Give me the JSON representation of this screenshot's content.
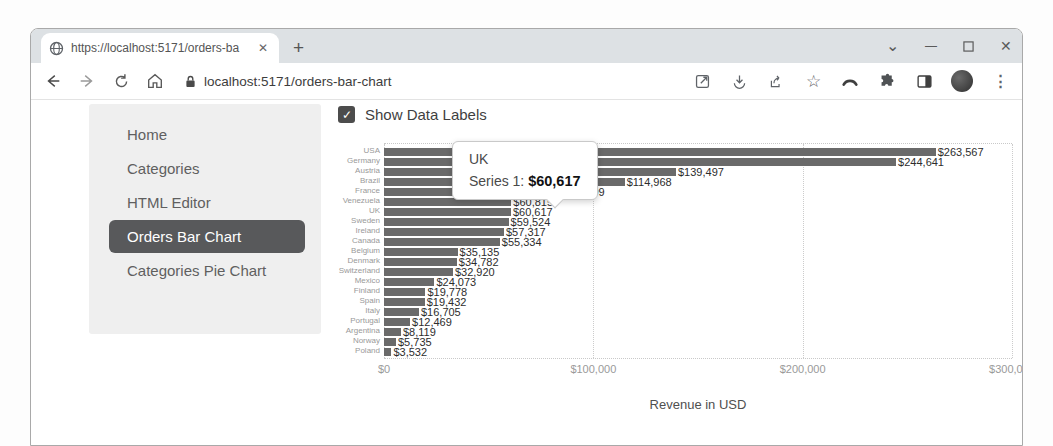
{
  "browser": {
    "tab": {
      "title": "https://localhost:5171/orders-ba",
      "close_glyph": "✕"
    },
    "new_tab_glyph": "+",
    "window_controls": {
      "restore_glyph": "⌄",
      "minimize_glyph": "—",
      "close_glyph": "✕"
    },
    "address": {
      "url": "localhost:5171/orders-bar-chart"
    },
    "toolbar_icon_names": [
      "open-in-new-icon",
      "download-icon",
      "share-icon",
      "bookmark-star-icon",
      "arc-icon",
      "extensions-puzzle-icon",
      "side-panel-icon",
      "profile-avatar",
      "menu-dots-icon"
    ],
    "menu_dots_glyph": "⋮",
    "star_glyph": "☆"
  },
  "sidebar": {
    "items": [
      {
        "label": "Home",
        "active": false
      },
      {
        "label": "Categories",
        "active": false
      },
      {
        "label": "HTML Editor",
        "active": false
      },
      {
        "label": "Orders Bar Chart",
        "active": true
      },
      {
        "label": "Categories Pie Chart",
        "active": false
      }
    ]
  },
  "main": {
    "show_data_labels": {
      "label": "Show Data Labels",
      "checked": true,
      "check_glyph": "✓"
    }
  },
  "chart_data": {
    "type": "bar",
    "orientation": "horizontal",
    "title": "",
    "xlabel": "Revenue in USD",
    "ylabel": "",
    "xlim": [
      0,
      300000
    ],
    "x_ticks": [
      "$0",
      "$100,000",
      "$200,000",
      "$300,000"
    ],
    "grid": "dotted-vertical",
    "bar_color": "#6a6a6a",
    "series_name": "Series 1",
    "categories": [
      "USA",
      "Germany",
      "Austria",
      "Brazil",
      "France",
      "Venezuela",
      "UK",
      "Sweden",
      "Ireland",
      "Canada",
      "Belgium",
      "Denmark",
      "Switzerland",
      "Mexico",
      "Finland",
      "Spain",
      "Italy",
      "Portugal",
      "Argentina",
      "Norway",
      "Poland"
    ],
    "values": [
      263567,
      244641,
      139497,
      114968,
      85499,
      60815,
      60617,
      59524,
      57317,
      55334,
      35135,
      34782,
      32920,
      24073,
      19778,
      19432,
      16705,
      12469,
      8119,
      5735,
      3532
    ],
    "data_labels": [
      "$263,567",
      "$244,641",
      "$139,497",
      "$114,968",
      "$85,499",
      "$60,815",
      "$60,617",
      "$59,524",
      "$57,317",
      "$55,334",
      "$35,135",
      "$34,782",
      "$32,920",
      "$24,073",
      "$19,778",
      "$19,432",
      "$16,705",
      "$12,469",
      "$8,119",
      "$5,735",
      "$3,532"
    ],
    "tooltip": {
      "category": "UK",
      "series_label": "Series 1:",
      "value": "$60,617"
    }
  }
}
